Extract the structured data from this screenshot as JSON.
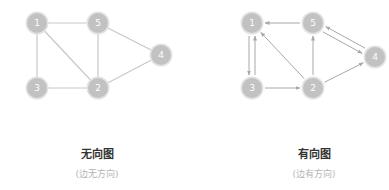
{
  "colors": {
    "node_fill": "#c2c2c2",
    "node_halo": "#e3e3e3",
    "edge_undirected": "#c8c8c8",
    "edge_directed": "#a8a8a8",
    "title": "#333333",
    "subtitle": "#b5b5b5"
  },
  "undirected": {
    "title": "无向图",
    "subtitle": "(边无方向)",
    "nodes": [
      {
        "id": "1",
        "x": 37,
        "y": 23
      },
      {
        "id": "5",
        "x": 98,
        "y": 23
      },
      {
        "id": "4",
        "x": 161,
        "y": 55
      },
      {
        "id": "3",
        "x": 37,
        "y": 88
      },
      {
        "id": "2",
        "x": 98,
        "y": 88
      }
    ],
    "edges": [
      [
        "1",
        "5"
      ],
      [
        "1",
        "3"
      ],
      [
        "1",
        "2"
      ],
      [
        "5",
        "2"
      ],
      [
        "5",
        "4"
      ],
      [
        "3",
        "2"
      ],
      [
        "2",
        "4"
      ]
    ]
  },
  "directed": {
    "title": "有向图",
    "subtitle": "(边有方向)",
    "nodes": [
      {
        "id": "1",
        "x": 252,
        "y": 23
      },
      {
        "id": "5",
        "x": 313,
        "y": 23
      },
      {
        "id": "4",
        "x": 375,
        "y": 57
      },
      {
        "id": "3",
        "x": 252,
        "y": 88
      },
      {
        "id": "2",
        "x": 313,
        "y": 88
      }
    ],
    "edges": [
      {
        "from": "5",
        "to": "1",
        "offset": 0
      },
      {
        "from": "2",
        "to": "1",
        "offset": 0
      },
      {
        "from": "3",
        "to": "2",
        "offset": 0
      },
      {
        "from": "2",
        "to": "5",
        "offset": 0
      },
      {
        "from": "2",
        "to": "4",
        "offset": 0
      },
      {
        "from": "5",
        "to": "4",
        "offset": 3
      },
      {
        "from": "4",
        "to": "5",
        "offset": 3
      },
      {
        "from": "1",
        "to": "3",
        "offset": 3
      },
      {
        "from": "3",
        "to": "1",
        "offset": 3
      }
    ]
  }
}
